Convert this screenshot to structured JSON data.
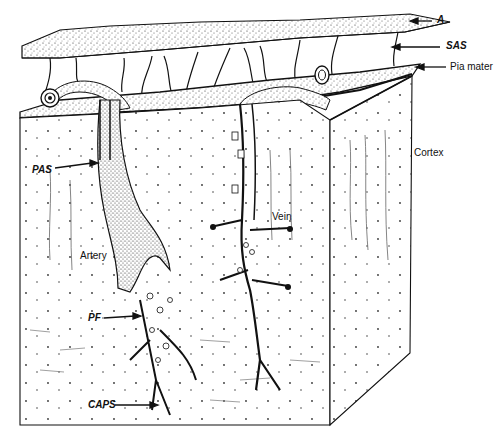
{
  "diagram": {
    "labels": {
      "arachnoid": "A",
      "subarachnoid_space": "SAS",
      "pia_mater": "Pia mater",
      "cortex": "Cortex",
      "perivascular_space": "PAS",
      "artery": "Artery",
      "vein": "Vein",
      "pial_funnel": "PF",
      "capillaries": "CAPS"
    },
    "colors": {
      "ink": "#111111",
      "paper": "#ffffff",
      "stipple": "#555555"
    }
  }
}
